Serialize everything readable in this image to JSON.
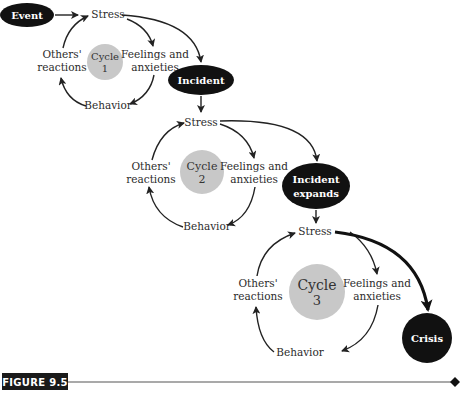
{
  "figure": {
    "label": "FIGURE 9.5"
  },
  "nodes": {
    "event": "Event",
    "incident": "Incident",
    "incident_expands": [
      "Incident",
      "expands"
    ],
    "crisis": "Crisis"
  },
  "cycles": [
    {
      "title": "Cycle",
      "number": "1",
      "stress": "Stress",
      "feelings": [
        "Feelings and",
        "anxieties"
      ],
      "behavior": "Behavior",
      "others": [
        "Others'",
        "reactions"
      ]
    },
    {
      "title": "Cycle",
      "number": "2",
      "stress": "Stress",
      "feelings": [
        "Feelings and",
        "anxieties"
      ],
      "behavior": "Behavior",
      "others": [
        "Others'",
        "reactions"
      ]
    },
    {
      "title": "Cycle",
      "number": "3",
      "stress": "Stress",
      "feelings": [
        "Feelings and",
        "anxieties"
      ],
      "behavior": "Behavior",
      "others": [
        "Others'",
        "reactions"
      ]
    }
  ],
  "colors": {
    "node": "#111111",
    "cycle_circle": "#c8c8c8",
    "line": "#222222"
  }
}
